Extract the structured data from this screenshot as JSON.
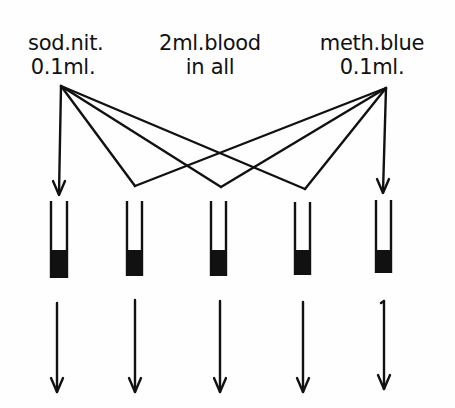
{
  "labels": {
    "left": {
      "line1": "sod.nit.",
      "line2": "0.1ml."
    },
    "center": {
      "line1": "2ml.blood",
      "line2": "in all"
    },
    "right": {
      "line1": "meth.blue",
      "line2": "0.1ml."
    }
  },
  "tubes": [
    {
      "id": 1,
      "x": 59
    },
    {
      "id": 2,
      "x": 134
    },
    {
      "id": 3,
      "x": 218
    },
    {
      "id": 4,
      "x": 302
    },
    {
      "id": 5,
      "x": 384
    }
  ],
  "colors": {
    "ink": "#111111",
    "background": "#fefefe"
  }
}
